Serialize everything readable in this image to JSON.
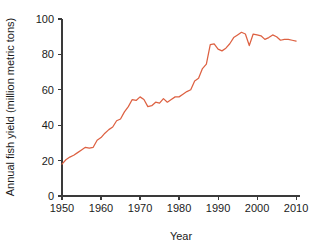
{
  "figure": {
    "background_color": "#ffffff",
    "axis_color": "#3a3a3a",
    "text_color": "#1b1b1b"
  },
  "chart_data": {
    "type": "line",
    "title": "",
    "subtitle": "",
    "xlabel": "Year",
    "ylabel": "Annual fish yield (million metric tons)",
    "xlim": [
      1950,
      2011
    ],
    "ylim": [
      0,
      100
    ],
    "xticks": [
      1950,
      1960,
      1970,
      1980,
      1990,
      2000,
      2010
    ],
    "xtick_labels": [
      "1950",
      "1960",
      "1970",
      "1980",
      "1990",
      "2000",
      "2010"
    ],
    "yticks": [
      0,
      20,
      40,
      60,
      80,
      100
    ],
    "ytick_labels": [
      "0",
      "20",
      "40",
      "60",
      "80",
      "100"
    ],
    "grid": false,
    "legend": false,
    "legend_position": "none",
    "series": [
      {
        "name": "Annual fish yield",
        "color": "#dd6142",
        "x": [
          1950,
          1951,
          1952,
          1953,
          1954,
          1955,
          1956,
          1957,
          1958,
          1959,
          1960,
          1961,
          1962,
          1963,
          1964,
          1965,
          1966,
          1967,
          1968,
          1969,
          1970,
          1971,
          1972,
          1973,
          1974,
          1975,
          1976,
          1977,
          1978,
          1979,
          1980,
          1981,
          1982,
          1983,
          1984,
          1985,
          1986,
          1987,
          1988,
          1989,
          1990,
          1991,
          1992,
          1993,
          1994,
          1995,
          1996,
          1997,
          1998,
          1999,
          2000,
          2001,
          2002,
          2003,
          2004,
          2005,
          2006,
          2007,
          2008,
          2009,
          2010
        ],
        "values": [
          18.0,
          20.5,
          22.0,
          23.0,
          24.5,
          26.0,
          27.5,
          27.0,
          27.5,
          31.5,
          33.0,
          35.5,
          37.5,
          39.0,
          42.5,
          43.5,
          47.5,
          50.5,
          54.5,
          54.0,
          56.0,
          54.5,
          50.5,
          51.0,
          53.0,
          52.5,
          55.0,
          53.0,
          54.5,
          56.0,
          56.0,
          57.5,
          59.0,
          60.0,
          65.0,
          66.5,
          72.0,
          74.5,
          85.5,
          86.0,
          83.0,
          82.0,
          83.5,
          86.0,
          89.5,
          91.0,
          92.5,
          91.5,
          85.0,
          91.5,
          91.0,
          90.5,
          88.5,
          89.5,
          91.0,
          90.0,
          88.0,
          88.5,
          88.5,
          88.0,
          87.5
        ],
        "units": "million metric tons"
      }
    ],
    "notes": {
      "start": "1950: about 18 million metric tons",
      "peak": "1996: about 93 million metric tons",
      "dip": "1998: sharp drop to about 85 million metric tons",
      "end": "2010: about 88 million metric tons"
    }
  }
}
